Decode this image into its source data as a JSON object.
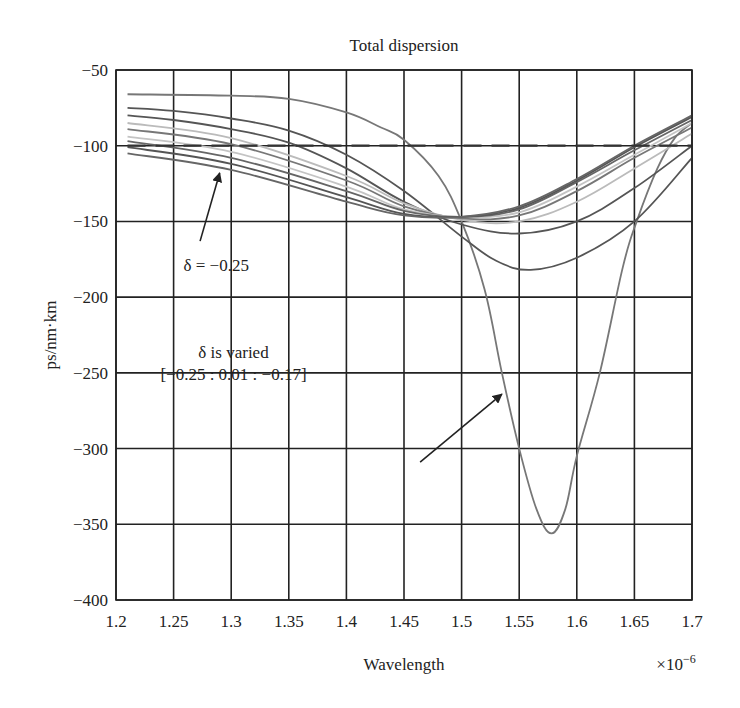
{
  "chart_data": {
    "type": "line",
    "title": "Total dispersion",
    "xlabel": "Wavelength",
    "x_multiplier": "×10",
    "x_multiplier_exp": "−6",
    "ylabel": "ps/nm·km",
    "xlim": [
      1.2,
      1.7
    ],
    "ylim": [
      -400,
      -50
    ],
    "grid": true,
    "xticks": [
      1.2,
      1.25,
      1.3,
      1.35,
      1.4,
      1.45,
      1.5,
      1.55,
      1.6,
      1.65,
      1.7
    ],
    "xtick_labels": [
      "1.2",
      "1.25",
      "1.3",
      "1.35",
      "1.4",
      "1.45",
      "1.5",
      "1.55",
      "1.6",
      "1.65",
      "1.7"
    ],
    "yticks": [
      -50,
      -100,
      -150,
      -200,
      -250,
      -300,
      -350,
      -400
    ],
    "ytick_labels": [
      "−50",
      "−100",
      "−150",
      "−200",
      "−250",
      "−300",
      "−350",
      "−400"
    ],
    "series": [
      {
        "name": "curve-deep",
        "color": "#777777",
        "dashed": false,
        "x": [
          1.21,
          1.3,
          1.35,
          1.4,
          1.43,
          1.45,
          1.48,
          1.5,
          1.52,
          1.535,
          1.55,
          1.565,
          1.578,
          1.59,
          1.6,
          1.62,
          1.64,
          1.652,
          1.67,
          1.685,
          1.7
        ],
        "y": [
          -66,
          -67,
          -69,
          -78,
          -88,
          -96,
          -120,
          -150,
          -195,
          -250,
          -300,
          -340,
          -356,
          -340,
          -305,
          -250,
          -180,
          -150,
          -115,
          -95,
          -85
        ]
      },
      {
        "name": "curve-2",
        "color": "#555555",
        "dashed": false,
        "x": [
          1.21,
          1.25,
          1.3,
          1.35,
          1.4,
          1.45,
          1.5,
          1.53,
          1.56,
          1.6,
          1.65,
          1.7
        ],
        "y": [
          -75,
          -77,
          -82,
          -90,
          -106,
          -130,
          -160,
          -176,
          -182,
          -174,
          -150,
          -108
        ]
      },
      {
        "name": "curve-3",
        "color": "#555555",
        "dashed": false,
        "x": [
          1.21,
          1.25,
          1.3,
          1.35,
          1.4,
          1.45,
          1.5,
          1.55,
          1.6,
          1.65,
          1.7
        ],
        "y": [
          -80,
          -83,
          -89,
          -98,
          -115,
          -137,
          -152,
          -158,
          -150,
          -128,
          -100
        ]
      },
      {
        "name": "curve-4",
        "color": "#bbbbbb",
        "dashed": false,
        "x": [
          1.21,
          1.3,
          1.4,
          1.45,
          1.5,
          1.55,
          1.6,
          1.65,
          1.7
        ],
        "y": [
          -85,
          -95,
          -120,
          -138,
          -149,
          -150,
          -137,
          -115,
          -92
        ]
      },
      {
        "name": "curve-5",
        "color": "#777777",
        "dashed": false,
        "x": [
          1.21,
          1.3,
          1.4,
          1.45,
          1.5,
          1.55,
          1.6,
          1.65,
          1.7
        ],
        "y": [
          -89,
          -99,
          -123,
          -140,
          -148,
          -146,
          -130,
          -108,
          -88
        ]
      },
      {
        "name": "curve-6",
        "color": "#c4c4c4",
        "dashed": false,
        "x": [
          1.21,
          1.3,
          1.4,
          1.45,
          1.5,
          1.55,
          1.6,
          1.65,
          1.7
        ],
        "y": [
          -94,
          -104,
          -127,
          -142,
          -147,
          -144,
          -127,
          -106,
          -85
        ]
      },
      {
        "name": "curve-7",
        "color": "#666666",
        "dashed": false,
        "x": [
          1.21,
          1.3,
          1.4,
          1.45,
          1.5,
          1.55,
          1.6,
          1.65,
          1.7
        ],
        "y": [
          -97,
          -108,
          -130,
          -143,
          -147,
          -142,
          -124,
          -103,
          -83
        ]
      },
      {
        "name": "curve-8",
        "color": "#555555",
        "dashed": false,
        "x": [
          1.21,
          1.3,
          1.4,
          1.45,
          1.5,
          1.55,
          1.6,
          1.65,
          1.7
        ],
        "y": [
          -101,
          -112,
          -134,
          -145,
          -147,
          -141,
          -123,
          -101,
          -81
        ]
      },
      {
        "name": "curve-9",
        "color": "#666666",
        "dashed": false,
        "x": [
          1.21,
          1.3,
          1.4,
          1.45,
          1.5,
          1.55,
          1.6,
          1.65,
          1.7
        ],
        "y": [
          -105,
          -116,
          -137,
          -146,
          -147,
          -140,
          -122,
          -100,
          -80
        ]
      },
      {
        "name": "reference-dashed",
        "color": "#333333",
        "dashed": true,
        "x": [
          1.21,
          1.7
        ],
        "y": [
          -100,
          -100
        ]
      }
    ],
    "annotations": [
      {
        "name": "delta-label",
        "lines": [
          "δ = −0.25"
        ],
        "at": [
          1.287,
          -183
        ],
        "arrow_from": [
          1.273,
          -163
        ],
        "arrow_to": [
          1.29,
          -118
        ]
      },
      {
        "name": "delta-varied-label",
        "lines": [
          "δ is varied",
          "[−0.25 : 0.01 : −0.17]"
        ],
        "at": [
          1.302,
          -240
        ],
        "arrow_from": [
          1.464,
          -309
        ],
        "arrow_to": [
          1.535,
          -264
        ]
      }
    ]
  }
}
